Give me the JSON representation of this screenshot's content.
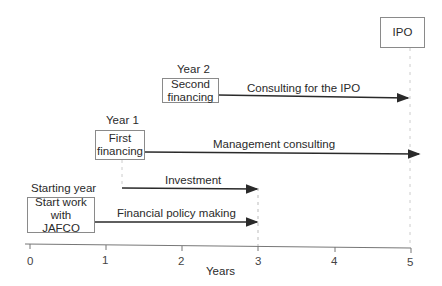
{
  "diagram": {
    "milestones": [
      {
        "label": "Starting year",
        "box": [
          "Start work",
          "with",
          "JAFCO"
        ]
      },
      {
        "label": "Year 1",
        "box": [
          "First",
          "financing"
        ]
      },
      {
        "label": "Year 2",
        "box": [
          "Second",
          "financing"
        ]
      },
      {
        "label": "",
        "box": [
          "IPO"
        ]
      }
    ],
    "activities": [
      {
        "label": "Investment",
        "start_year": 1.2,
        "end_year": 3
      },
      {
        "label": "Financial policy making",
        "start_year": 0.85,
        "end_year": 3
      },
      {
        "label": "Management consulting",
        "start_year": 1.5,
        "end_year": 5.1
      },
      {
        "label": "Consulting for the IPO",
        "start_year": 2.5,
        "end_year": 5
      }
    ],
    "axis": {
      "label": "Years",
      "ticks": [
        "0",
        "1",
        "2",
        "3",
        "4",
        "5"
      ]
    },
    "colors": {
      "line": "#2a2a2a",
      "axis": "#777777",
      "box_border": "#8a8a8a",
      "dashed": "#bbbbbb"
    }
  }
}
